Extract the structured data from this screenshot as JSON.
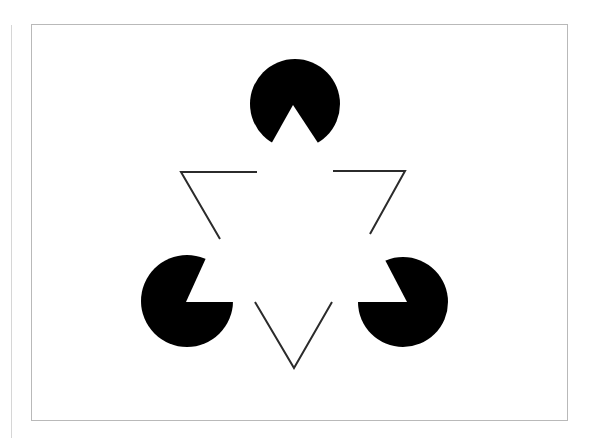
{
  "figure": {
    "colors": {
      "background": "#ffffff",
      "frame": "#b9b9b9",
      "left_rule": "#d6d6d6",
      "inducer_fill": "#000000",
      "outline_stroke": "#2b2b2b"
    },
    "inducers": [
      {
        "name": "top",
        "cx": 295,
        "cy": 104,
        "r": 45,
        "mouth": [
          [
            270,
            146
          ],
          [
            293,
            105
          ],
          [
            320,
            146
          ]
        ]
      },
      {
        "name": "bottom-left",
        "cx": 187,
        "cy": 301,
        "r": 46,
        "mouth": [
          [
            206,
            258
          ],
          [
            186,
            302
          ],
          [
            233,
            302
          ]
        ]
      },
      {
        "name": "bottom-right",
        "cx": 403,
        "cy": 302,
        "r": 45,
        "mouth": [
          [
            358,
            302
          ],
          [
            407,
            302
          ],
          [
            384,
            258
          ]
        ]
      }
    ],
    "outline_segments": [
      {
        "name": "top-left-corner",
        "points": [
          [
            257,
            172
          ],
          [
            181,
            172
          ],
          [
            220,
            239
          ]
        ]
      },
      {
        "name": "top-right-corner",
        "points": [
          [
            333,
            171
          ],
          [
            405,
            171
          ],
          [
            370,
            234
          ]
        ]
      },
      {
        "name": "bottom-corner",
        "points": [
          [
            255,
            302
          ],
          [
            294,
            368
          ],
          [
            332,
            302
          ]
        ]
      }
    ]
  }
}
